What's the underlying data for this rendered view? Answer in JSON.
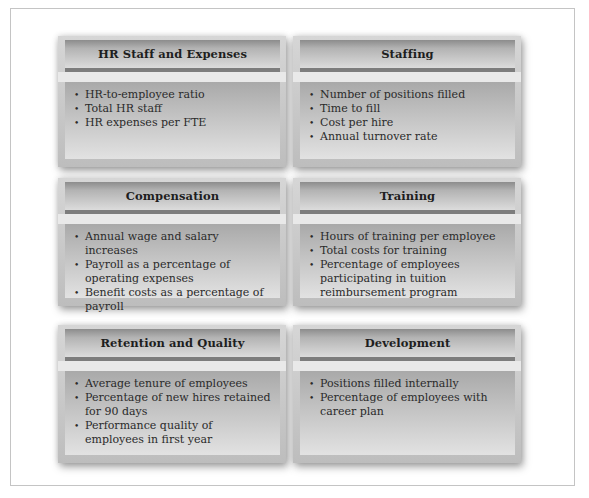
{
  "cards": [
    {
      "title": "HR Staff and Expenses",
      "items": [
        "HR-to-employee ratio",
        "Total HR staff",
        "HR expenses per FTE"
      ]
    },
    {
      "title": "Staffing",
      "items": [
        "Number of positions filled",
        "Time to fill",
        "Cost per hire",
        "Annual turnover rate"
      ]
    },
    {
      "title": "Compensation",
      "items": [
        "Annual wage and salary increases",
        "Payroll as a percentage of operating expenses",
        "Benefit costs as a percentage of payroll"
      ]
    },
    {
      "title": "Training",
      "items": [
        "Hours of training per employee",
        "Total costs for training",
        "Percentage of employees participating in tuition reimbursement program"
      ]
    },
    {
      "title": "Retention and Quality",
      "items": [
        "Average tenure of employees",
        "Percentage of new hires retained for 90 days",
        "Performance quality of employees in first year"
      ]
    },
    {
      "title": "Development",
      "items": [
        "Positions filled internally",
        "Percentage of employees with career plan"
      ]
    }
  ],
  "bullet_glyph": "•",
  "colors": {
    "header_dark": "#8c8c8c",
    "header_light": "#dcdcdc",
    "body_dark": "#a9a9a9",
    "body_light": "#e2e2e2",
    "text": "#2a2a2a"
  }
}
